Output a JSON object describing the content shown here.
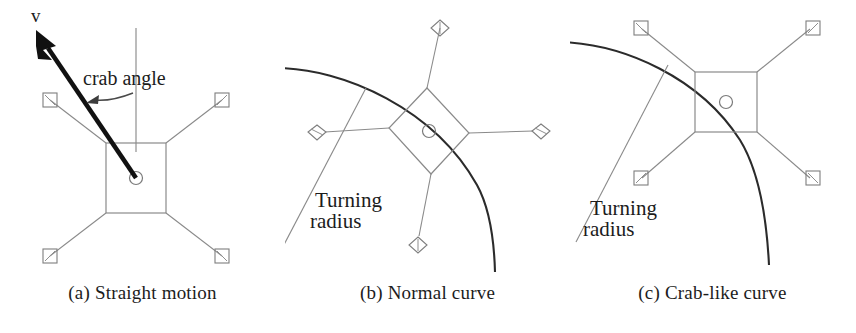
{
  "figure": {
    "background_color": "#ffffff",
    "ink_color": "#1c1c1c",
    "thin_line_color": "#8a8a8a",
    "arc_color": "#2b2b2b",
    "arrow_color": "#111111"
  },
  "panels": [
    {
      "id": "a",
      "caption": "(a) Straight motion",
      "labels": {
        "velocity": "v",
        "crab_angle": "crab angle"
      },
      "icons": {
        "velocity_arrow": "velocity-arrow-icon",
        "crab_angle_arrow": "curved-arrow-icon",
        "reference_line": "vertical-reference-line",
        "chassis": "chassis-rectangle",
        "hub": "center-hub-circle",
        "wheel": "square-wheel-icon"
      },
      "wheel_count": 4,
      "wheel_shape": "square",
      "has_arc": false,
      "has_radius_line": false
    },
    {
      "id": "b",
      "caption": "(b) Normal curve",
      "labels": {
        "turning_radius_line1": "Turning",
        "turning_radius_line2": "radius"
      },
      "icons": {
        "arc": "turning-arc",
        "radius_line": "turning-radius-line",
        "chassis": "chassis-rectangle-rotated",
        "hub": "center-hub-circle",
        "wheel": "diamond-wheel-icon"
      },
      "wheel_count": 4,
      "wheel_shape": "diamond",
      "has_arc": true,
      "has_radius_line": true
    },
    {
      "id": "c",
      "caption": "(c) Crab-like curve",
      "labels": {
        "turning_radius_line1": "Turning",
        "turning_radius_line2": "radius"
      },
      "icons": {
        "arc": "turning-arc",
        "radius_line": "turning-radius-line",
        "chassis": "chassis-rectangle",
        "hub": "center-hub-circle",
        "wheel": "square-wheel-icon"
      },
      "wheel_count": 4,
      "wheel_shape": "square",
      "has_arc": true,
      "has_radius_line": true
    }
  ]
}
